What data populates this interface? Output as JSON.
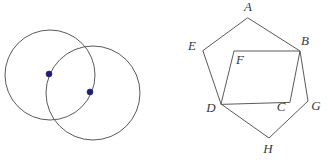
{
  "figure": {
    "canvas": {
      "width": 328,
      "height": 164
    },
    "colors": {
      "background": "#ffffff",
      "stroke": "#5a5a5a",
      "dot": "#1f1f7a",
      "label": "#3a3a3a"
    }
  },
  "left_diagram": {
    "name": "intersecting-circles",
    "circles": [
      {
        "id": "circle-left",
        "cx": 50,
        "cy": 75,
        "r": 45
      },
      {
        "id": "circle-right",
        "cx": 93,
        "cy": 93,
        "r": 47
      }
    ],
    "center_points": [
      {
        "id": "center-left",
        "cx": 49,
        "cy": 74,
        "r": 3,
        "label": ""
      },
      {
        "id": "center-right",
        "cx": 90,
        "cy": 92,
        "r": 3,
        "label": ""
      }
    ]
  },
  "right_diagram": {
    "name": "pentagon-with-parallelogram",
    "vertices": [
      {
        "id": "A",
        "label": "A",
        "x": 248,
        "y": 18,
        "label_x": 248,
        "label_y": 8
      },
      {
        "id": "B",
        "label": "B",
        "x": 300,
        "y": 51,
        "label_x": 305,
        "label_y": 42
      },
      {
        "id": "G",
        "label": "G",
        "x": 308,
        "y": 101,
        "label_x": 316,
        "label_y": 107
      },
      {
        "id": "H",
        "label": "H",
        "x": 269,
        "y": 138,
        "label_x": 268,
        "label_y": 150
      },
      {
        "id": "D",
        "label": "D",
        "x": 221,
        "y": 104,
        "label_x": 211,
        "label_y": 109
      },
      {
        "id": "E",
        "label": "E",
        "x": 203,
        "y": 51,
        "label_x": 192,
        "label_y": 47
      },
      {
        "id": "F",
        "label": "F",
        "x": 234,
        "y": 51,
        "label_x": 240,
        "label_y": 61
      },
      {
        "id": "C",
        "label": "C",
        "x": 290,
        "y": 102,
        "label_x": 281,
        "label_y": 108
      }
    ],
    "outer_pentagon_path": "A,B,G,H,D,E",
    "inner_parallelogram_path": "D,F,B,C",
    "edges": [
      {
        "from": "A",
        "to": "B"
      },
      {
        "from": "B",
        "to": "G"
      },
      {
        "from": "G",
        "to": "H"
      },
      {
        "from": "H",
        "to": "D"
      },
      {
        "from": "D",
        "to": "E"
      },
      {
        "from": "E",
        "to": "A"
      },
      {
        "from": "D",
        "to": "F"
      },
      {
        "from": "F",
        "to": "B"
      },
      {
        "from": "B",
        "to": "C"
      },
      {
        "from": "C",
        "to": "D"
      }
    ]
  }
}
